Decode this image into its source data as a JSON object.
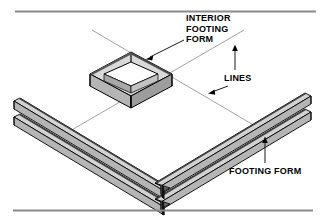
{
  "figure": {
    "type": "isometric-technical-illustration",
    "background_color": "#ffffff"
  },
  "rules": {
    "top_rule": {
      "name": "top-horizontal-rule",
      "color": "#8a8a8a"
    },
    "bottom_rule": {
      "name": "bottom-horizontal-rule",
      "color": "#8a8a8a"
    }
  },
  "labels": {
    "interior_footing_form": {
      "line1": "INTERIOR",
      "line2": "FOOTING",
      "line3": "FORM"
    },
    "lines": "LINES",
    "footing_form": "FOOTING FORM"
  },
  "colors": {
    "outline": "#000000",
    "face_light": "#d9d9d9",
    "face_mid": "#b5b5b5",
    "face_dark": "#8f8f8f",
    "edge_dark": "#3a3a3a",
    "string_line": "#7a7a7a",
    "rule": "#8a8a8a"
  },
  "parts": {
    "interior_footing_form": "square isometric box frame, open center",
    "footing_form_left_arm": "two parallel boards running up-left",
    "footing_form_right_arm": "two parallel boards running up-right",
    "corner": "V shaped junction at bottom center",
    "string_lines": "two thin crossing layout lines"
  }
}
